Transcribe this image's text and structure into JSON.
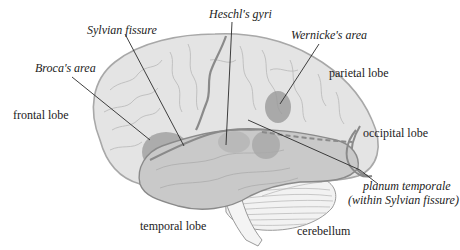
{
  "diagram": {
    "type": "labeled-illustration",
    "colors": {
      "background": "#ffffff",
      "cortex": "#e4e4e4",
      "cortex_outline": "#a8a8a8",
      "temporal_lobe": "#c9c9c9",
      "region_highlight": "#9a9a9a",
      "fissure": "#8a8a8a",
      "leader_line": "#2a2a2a",
      "cerebellum": "#f2f2f2",
      "text": "#222222"
    },
    "labels": {
      "sylvian_fissure": "Sylvian fissure",
      "heschls_gyri": "Heschl's gyri",
      "wernickes_area": "Wernicke's area",
      "brocas_area": "Broca's area",
      "parietal_lobe": "parietal lobe",
      "frontal_lobe": "frontal lobe",
      "occipital_lobe": "occipital lobe",
      "planum_temporale_line1": "planum temporale",
      "planum_temporale_line2": "(within Sylvian fissure)",
      "temporal_lobe": "temporal lobe",
      "cerebellum": "cerebellum"
    }
  }
}
